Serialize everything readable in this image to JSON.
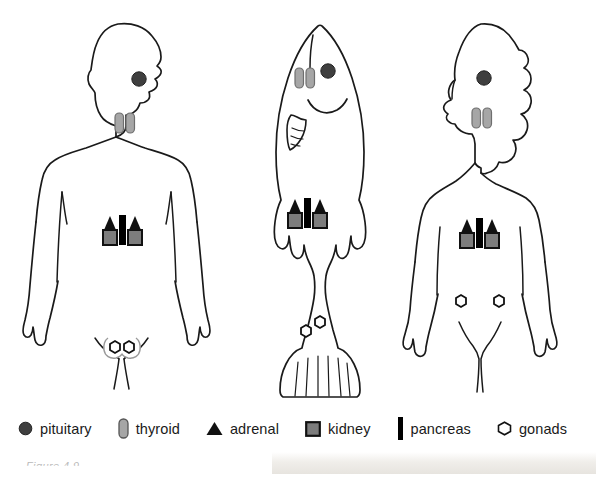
{
  "figure": {
    "caption": "Figure 4.9"
  },
  "legend": {
    "items": [
      {
        "id": "pituitary",
        "label": "pituitary",
        "icon": "filled-circle-icon",
        "color": "#3f3f3f"
      },
      {
        "id": "thyroid",
        "label": "thyroid",
        "icon": "rounded-pill-icon",
        "color": "#a6a6a6"
      },
      {
        "id": "adrenal",
        "label": "adrenal",
        "icon": "filled-triangle-icon",
        "color": "#111111"
      },
      {
        "id": "kidney",
        "label": "kidney",
        "icon": "filled-square-icon",
        "color": "#7d7d7d"
      },
      {
        "id": "pancreas",
        "label": "pancreas",
        "icon": "vertical-bar-icon",
        "color": "#000000"
      },
      {
        "id": "gonads",
        "label": "gonads",
        "icon": "hollow-hexagon-icon",
        "color": "#ffffff"
      }
    ]
  },
  "organisms": [
    {
      "id": "human-male",
      "name": "human male",
      "organs": [
        "pituitary",
        "thyroid",
        "adrenal",
        "kidney",
        "pancreas",
        "gonads"
      ]
    },
    {
      "id": "fish",
      "name": "fish",
      "organs": [
        "pituitary",
        "thyroid",
        "adrenal",
        "kidney",
        "pancreas",
        "gonads"
      ]
    },
    {
      "id": "human-female",
      "name": "human female",
      "organs": [
        "pituitary",
        "thyroid",
        "adrenal",
        "kidney",
        "pancreas",
        "gonads"
      ]
    }
  ],
  "colors": {
    "outline": "#1a1a1a",
    "background": "#ffffff",
    "pituitary": "#3f3f3f",
    "thyroid": "#a6a6a6",
    "thyroid_stroke": "#6e6e6e",
    "adrenal": "#111111",
    "kidney": "#7d7d7d",
    "kidney_stroke": "#111111",
    "pancreas": "#000000",
    "gonads_fill": "#ffffff",
    "gonads_stroke": "#111111"
  }
}
